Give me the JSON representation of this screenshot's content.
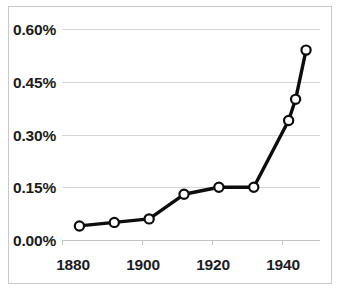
{
  "chart_data": {
    "type": "line",
    "title": "",
    "subtitle": "",
    "xlabel": "",
    "ylabel": "",
    "x": [
      1880,
      1890,
      1900,
      1910,
      1920,
      1930,
      1940,
      1942,
      1945
    ],
    "values": [
      0.04,
      0.05,
      0.06,
      0.13,
      0.15,
      0.15,
      0.34,
      0.4,
      0.54
    ],
    "series": [
      {
        "name": "",
        "values": [
          0.04,
          0.05,
          0.06,
          0.13,
          0.15,
          0.15,
          0.34,
          0.4,
          0.54
        ]
      }
    ],
    "xlim": [
      1875,
      1949
    ],
    "ylim": [
      0.0,
      0.6
    ],
    "ytick_values": [
      0.0,
      0.15,
      0.3,
      0.45,
      0.6
    ],
    "ytick_labels": [
      "0.00%",
      "0.15%",
      "0.30%",
      "0.45%",
      "0.60%"
    ],
    "xtick_values": [
      1880,
      1900,
      1920,
      1940
    ],
    "xtick_labels": [
      "1880",
      "1900",
      "1920",
      "1940"
    ],
    "grid": "horizontal",
    "legend": "none",
    "marker": "circle-open",
    "line_color": "#0d0d0d",
    "marker_fill": "#ffffff",
    "gridline_color": "#d6d6d6",
    "frame_color": "#c9c9c9",
    "annotations": []
  }
}
